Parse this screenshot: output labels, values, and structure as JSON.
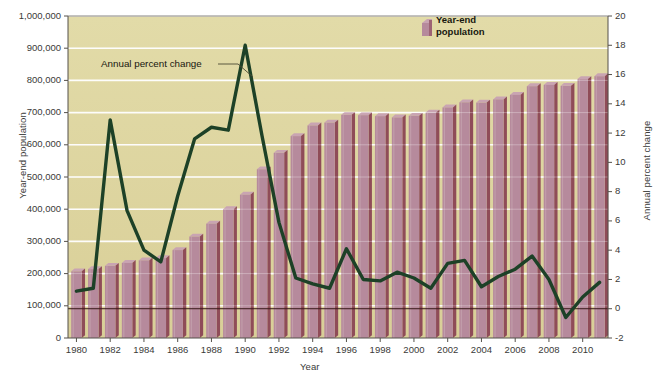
{
  "chart_data": {
    "type": "bar",
    "title": "",
    "subtitle": "",
    "xlabel": "Year",
    "ylabel": "Year-end population",
    "y2label": "Annual percent change",
    "grid": true,
    "legend_position": "top-center-right",
    "categories": [
      1980,
      1981,
      1982,
      1983,
      1984,
      1985,
      1986,
      1987,
      1988,
      1989,
      1990,
      1991,
      1992,
      1993,
      1994,
      1995,
      1996,
      1997,
      1998,
      1999,
      2000,
      2001,
      2002,
      2003,
      2004,
      2005,
      2006,
      2007,
      2008,
      2009,
      2010,
      2011
    ],
    "xtick_labels": [
      "1980",
      "1982",
      "1984",
      "1986",
      "1988",
      "1990",
      "1992",
      "1994",
      "1996",
      "1998",
      "2000",
      "2002",
      "2004",
      "2006",
      "2008",
      "2010"
    ],
    "xticks": [
      1980,
      1982,
      1984,
      1986,
      1988,
      1990,
      1992,
      1994,
      1996,
      1998,
      2000,
      2002,
      2004,
      2006,
      2008,
      2010
    ],
    "ylim": [
      0,
      1000000
    ],
    "yticks": [
      0,
      100000,
      200000,
      300000,
      400000,
      500000,
      600000,
      700000,
      800000,
      900000,
      1000000
    ],
    "ytick_labels": [
      "0",
      "100,000",
      "200,000",
      "300,000",
      "400,000",
      "500,000",
      "600,000",
      "700,000",
      "800,000",
      "900,000",
      "1,000,000"
    ],
    "y2lim": [
      -2,
      20
    ],
    "y2ticks": [
      -2,
      0,
      2,
      4,
      6,
      8,
      10,
      12,
      14,
      16,
      18,
      20
    ],
    "y2tick_labels": [
      "-2",
      "0",
      "2",
      "4",
      "6",
      "8",
      "10",
      "12",
      "14",
      "16",
      "18",
      "20"
    ],
    "series": [
      {
        "name": "Year-end population",
        "type": "bar",
        "axis": "left",
        "color": "#b68a9c",
        "values": [
          207000,
          214000,
          224000,
          233000,
          241000,
          248000,
          273000,
          315000,
          355000,
          400000,
          445000,
          524000,
          575000,
          627000,
          660000,
          669000,
          693000,
          692000,
          689000,
          685000,
          690000,
          700000,
          716000,
          732000,
          731000,
          741000,
          755000,
          782000,
          786000,
          783000,
          804000,
          813000
        ]
      },
      {
        "name": "Annual percent change",
        "type": "line",
        "axis": "right",
        "color": "#1d4127",
        "values": [
          1.2,
          1.4,
          12.9,
          6.7,
          4.0,
          3.2,
          7.7,
          11.6,
          12.4,
          12.2,
          18.0,
          11.8,
          5.9,
          2.1,
          1.7,
          1.4,
          4.1,
          2.0,
          1.9,
          2.5,
          2.1,
          1.4,
          3.1,
          3.3,
          1.5,
          2.2,
          2.7,
          3.6,
          2.0,
          -0.6,
          0.8,
          1.8
        ]
      }
    ],
    "annotations": [
      {
        "text": "Annual percent change",
        "x": 1983.8,
        "y": 16.7,
        "leader_to_x": 1988.8,
        "leader_to_y": 15.1
      }
    ],
    "legend": [
      {
        "label_line1": "Year-end",
        "label_line2": "population",
        "swatch_color": "#b68a9c"
      }
    ],
    "colors": {
      "plot_background": "#ded5a1",
      "grid": "#ffffff",
      "bar_face": "#b68a9c",
      "bar_shadow": "#8f4c58",
      "bar_top": "#c9a4b2",
      "line": "#1d4127",
      "zero_line": "#3a1a1a",
      "axis_text": "#3a3a38",
      "page_background": "#ffffff"
    }
  },
  "labels": {
    "axis_x_title": "Year",
    "axis_y_left_title": "Year-end population",
    "axis_y_right_title": "Annual percent change",
    "annotation_line": "Annual percent change",
    "legend_title_line1": "Year-end",
    "legend_title_line2": "population"
  }
}
